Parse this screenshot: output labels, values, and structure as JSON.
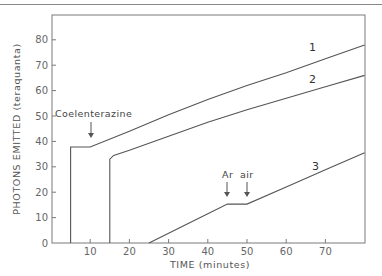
{
  "chart_data": {
    "type": "line",
    "title": "",
    "xlabel": "TIME (minutes)",
    "ylabel": "PHOTONS EMITTED (teraquanta)",
    "xlim": [
      0,
      80
    ],
    "ylim": [
      0,
      90
    ],
    "x_ticks": [
      10,
      20,
      30,
      40,
      50,
      60,
      70
    ],
    "x_tick_labels": [
      "10",
      "20",
      "30",
      "40",
      "50",
      "60",
      "70"
    ],
    "y_ticks": [
      0,
      10,
      20,
      30,
      40,
      50,
      60,
      70,
      80
    ],
    "y_tick_labels": [
      "0",
      "10",
      "20",
      "30",
      "40",
      "50",
      "60",
      "70",
      "80"
    ],
    "grid": false,
    "legend": "none (inline curve labels)",
    "series": [
      {
        "name": "1",
        "x": [
          5,
          5,
          10,
          20,
          30,
          40,
          50,
          60,
          70,
          80
        ],
        "y": [
          0,
          37.8,
          37.8,
          44,
          50.5,
          56.5,
          62,
          67,
          72.5,
          78
        ]
      },
      {
        "name": "2",
        "x": [
          15,
          15,
          16,
          20,
          30,
          40,
          50,
          60,
          70,
          80
        ],
        "y": [
          0,
          33,
          34.5,
          36.5,
          42,
          47.5,
          52.5,
          57,
          61.5,
          66
        ]
      },
      {
        "name": "3",
        "x": [
          25,
          30,
          40,
          45,
          50,
          60,
          70,
          80
        ],
        "y": [
          0,
          3.8,
          11.5,
          15.3,
          15.3,
          22,
          28.8,
          35.5
        ]
      }
    ],
    "annotations": [
      {
        "text": "Coelenterazine",
        "x": 10,
        "y": 37.8,
        "type": "arrow-down"
      },
      {
        "text": "Ar",
        "x": 45,
        "y": 15.3,
        "type": "arrow-down"
      },
      {
        "text": "air",
        "x": 50,
        "y": 15.3,
        "type": "arrow-down"
      }
    ]
  },
  "labels": {
    "x_axis_title": "TIME (minutes)",
    "y_axis_title": "PHOTONS EMITTED (teraquanta)",
    "series_1": "1",
    "series_2": "2",
    "series_3": "3",
    "annotation_coelenterazine": "Coelenterazine",
    "annotation_ar": "Ar",
    "annotation_air": "air"
  }
}
